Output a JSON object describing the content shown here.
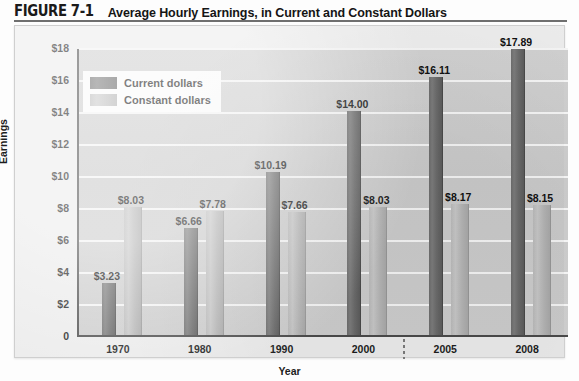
{
  "figure": {
    "number": "FIGURE 7-1",
    "title": "Average Hourly Earnings, in Current and Constant Dollars"
  },
  "chart_data": {
    "type": "bar",
    "title": "Average Hourly Earnings, in Current and Constant Dollars",
    "xlabel": "Year",
    "ylabel": "Earnings",
    "categories": [
      "1970",
      "1980",
      "1990",
      "2000",
      "2005",
      "2008"
    ],
    "series": [
      {
        "name": "Current dollars",
        "color": "#6c6c6c",
        "values": [
          3.23,
          6.66,
          10.19,
          14.0,
          16.11,
          17.89
        ],
        "labels": [
          "$3.23",
          "$6.66",
          "$10.19",
          "$14.00",
          "$16.11",
          "$17.89"
        ]
      },
      {
        "name": "Constant dollars",
        "color": "#b9b9b9",
        "values": [
          8.03,
          7.78,
          7.66,
          8.03,
          8.17,
          8.15
        ],
        "labels": [
          "$8.03",
          "$7.78",
          "$7.66",
          "$8.03",
          "$8.17",
          "$8.15"
        ]
      }
    ],
    "ylim": [
      0,
      18
    ],
    "ytick_values": [
      0,
      2,
      4,
      6,
      8,
      10,
      12,
      14,
      16,
      18
    ],
    "ytick_labels": [
      "0",
      "$2",
      "$4",
      "$6",
      "$8",
      "$10",
      "$12",
      "$14",
      "$16",
      "$18"
    ],
    "grid": true,
    "legend_position": "upper-left-inside",
    "axis_break_after_category": "2000"
  }
}
